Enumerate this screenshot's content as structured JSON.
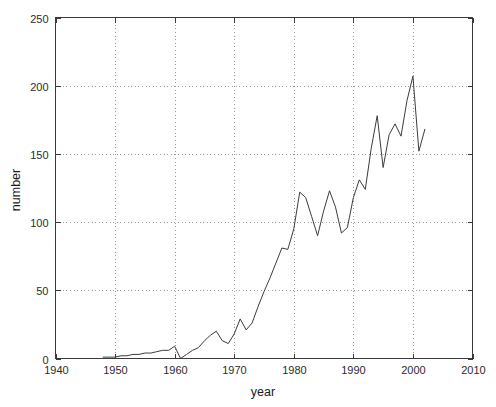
{
  "chart_data": {
    "type": "line",
    "title": "",
    "xlabel": "year",
    "ylabel": "number",
    "xlim": [
      1940,
      2010
    ],
    "ylim": [
      0,
      250
    ],
    "xticks": [
      1940,
      1950,
      1960,
      1970,
      1980,
      1990,
      2000,
      2010
    ],
    "yticks": [
      0,
      50,
      100,
      150,
      200,
      250
    ],
    "xtick_labels": [
      "1940",
      "1950",
      "1960",
      "1970",
      "1980",
      "1990",
      "2000",
      "2010"
    ],
    "ytick_labels": [
      "0",
      "50",
      "100",
      "150",
      "200",
      "250"
    ],
    "grid": true,
    "grid_style": "dotted",
    "legend": false,
    "legend_position": "none",
    "line_color": "#3c3c3c",
    "background_color": "#ffffff",
    "series": [
      {
        "name": "number",
        "x": [
          1948,
          1949,
          1950,
          1951,
          1952,
          1953,
          1954,
          1955,
          1956,
          1957,
          1958,
          1959,
          1960,
          1961,
          1962,
          1963,
          1964,
          1965,
          1966,
          1967,
          1968,
          1969,
          1970,
          1971,
          1972,
          1973,
          1974,
          1975,
          1976,
          1977,
          1978,
          1979,
          1980,
          1981,
          1982,
          1983,
          1984,
          1985,
          1986,
          1987,
          1988,
          1989,
          1990,
          1991,
          1992,
          1993,
          1994,
          1995,
          1996,
          1997,
          1998,
          1999,
          2000,
          2001,
          2002
        ],
        "values": [
          1,
          1,
          1,
          2,
          2,
          3,
          3,
          4,
          4,
          5,
          6,
          6,
          9,
          0,
          3,
          6,
          8,
          13,
          17,
          20,
          13,
          11,
          18,
          29,
          21,
          26,
          38,
          49,
          59,
          70,
          81,
          80,
          95,
          122,
          118,
          104,
          90,
          108,
          123,
          111,
          92,
          96,
          118,
          131,
          124,
          154,
          178,
          140,
          164,
          172,
          163,
          189,
          207,
          152,
          168
        ]
      }
    ],
    "annotations": []
  },
  "figure": {
    "axis_label_x": "year",
    "axis_label_y": "number"
  }
}
